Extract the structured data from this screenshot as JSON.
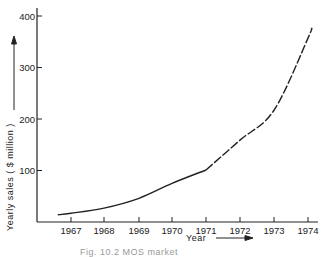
{
  "chart_data": {
    "type": "line",
    "title": "",
    "xlabel": "Year",
    "ylabel": "Yearly sales ( $ million )",
    "x": [
      1967,
      1968,
      1969,
      1970,
      1971,
      1972,
      1973,
      1974
    ],
    "series": [
      {
        "name": "Yearly sales (actual, solid)",
        "style": "solid",
        "x": [
          1966.6,
          1967,
          1968,
          1969,
          1970,
          1971
        ],
        "values": [
          14,
          17,
          27,
          46,
          75,
          101
        ]
      },
      {
        "name": "Yearly sales (projected, dashed)",
        "style": "dashed",
        "x": [
          1971,
          1972,
          1973,
          1974,
          1974.1
        ],
        "values": [
          101,
          159,
          217,
          357,
          377
        ]
      }
    ],
    "x_ticks": [
      "1967",
      "1968",
      "1969",
      "1970",
      "1971",
      "1972",
      "1973",
      "1974"
    ],
    "y_ticks": [
      "100",
      "200",
      "300",
      "400"
    ],
    "ylim": [
      0,
      410
    ],
    "grid": false,
    "legend": "none",
    "caption": "Fig. 10.2   MOS market projection"
  },
  "labels": {
    "xlabel": "Year",
    "ylabel": "Yearly sales ( $ million )",
    "caption": "Fig. 10.2   MOS market"
  }
}
